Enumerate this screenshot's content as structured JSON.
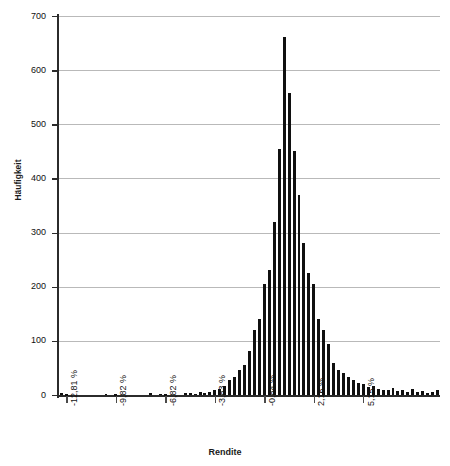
{
  "chart_data": {
    "type": "bar",
    "title": "",
    "subtitle": "",
    "xlabel": "Rendite",
    "ylabel": "Häufigkeit",
    "grid": true,
    "legend": null,
    "ylim": [
      0,
      700
    ],
    "ytick_labels": [
      "0",
      "100",
      "200",
      "300",
      "400",
      "500",
      "600",
      "700"
    ],
    "ytick_values": [
      0,
      100,
      200,
      300,
      400,
      500,
      600,
      700
    ],
    "xtick_labels": [
      "-12,81 %",
      "-9,82 %",
      "-6,82 %",
      "-3,83 %",
      "-0,84 %",
      "2,16 %",
      "5,15 %"
    ],
    "xtick_values": [
      -12.81,
      -9.82,
      -6.82,
      -3.83,
      -0.84,
      2.16,
      5.15
    ],
    "bar_color": "#101010",
    "grid_color": "#b9b9b9",
    "axis_color": "#2b2b2b",
    "bin_width_percent": 0.3,
    "note": "Histogramm der Renditen; Klassenbreite ca. 0,3 Prozentpunkte",
    "categories": [
      "-13,10 %",
      "-12,81 %",
      "-12,51 %",
      "-12,21 %",
      "-11,91 %",
      "-11,61 %",
      "-11,31 %",
      "-11,01 %",
      "-10,71 %",
      "-10,41 %",
      "-10,11 %",
      "-9,82 %",
      "-9,52 %",
      "-9,22 %",
      "-8,92 %",
      "-8,62 %",
      "-8,32 %",
      "-8,02 %",
      "-7,72 %",
      "-7,42 %",
      "-7,12 %",
      "-6,82 %",
      "-6,52 %",
      "-6,22 %",
      "-5,92 %",
      "-5,62 %",
      "-5,33 %",
      "-5,03 %",
      "-4,73 %",
      "-4,43 %",
      "-4,13 %",
      "-3,83 %",
      "-3,53 %",
      "-3,23 %",
      "-2,93 %",
      "-2,63 %",
      "-2,33 %",
      "-2,04 %",
      "-1,74 %",
      "-1,44 %",
      "-1,14 %",
      "-0,84 %",
      "-0,54 %",
      "-0,24 %",
      "0,06 %",
      "0,36 %",
      "0,66 %",
      "0,96 %",
      "1,26 %",
      "1,56 %",
      "1,86 %",
      "2,16 %",
      "2,45 %",
      "2,75 %",
      "3,05 %",
      "3,35 %",
      "3,65 %",
      "3,95 %",
      "4,25 %",
      "4,55 %",
      "4,85 %",
      "5,15 %",
      "5,45 %",
      "5,75 %",
      "6,05 %",
      "6,34 %",
      "6,64 %",
      "6,94 %",
      "7,24 %",
      "7,54 %",
      "7,84 %",
      "8,14 %",
      "8,44 %",
      "8,74 %",
      "9,04 %",
      "9,34 %",
      "9,64 %"
    ],
    "values": [
      3,
      1,
      0,
      0,
      0,
      0,
      0,
      0,
      0,
      2,
      0,
      1,
      0,
      0,
      0,
      0,
      0,
      0,
      3,
      0,
      2,
      1,
      0,
      0,
      0,
      4,
      3,
      2,
      5,
      4,
      6,
      9,
      11,
      16,
      27,
      33,
      47,
      56,
      81,
      120,
      140,
      205,
      230,
      320,
      455,
      662,
      557,
      450,
      370,
      280,
      225,
      205,
      140,
      120,
      95,
      60,
      47,
      40,
      33,
      27,
      22,
      20,
      14,
      16,
      12,
      10,
      9,
      13,
      7,
      9,
      6,
      11,
      5,
      8,
      4,
      6,
      9
    ]
  }
}
